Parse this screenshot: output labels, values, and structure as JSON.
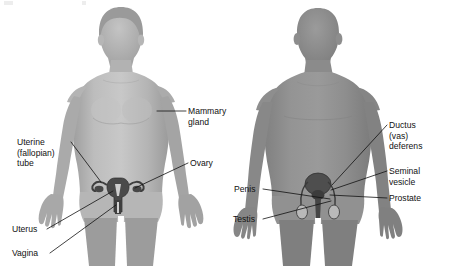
{
  "figure": {
    "background_color": "#ffffff",
    "width": 449,
    "height": 275,
    "label_color": "#111111",
    "leader_color": "#111111"
  },
  "female_figure": {
    "name": "female-body-silhouette",
    "body_fill": "#b0b0b0",
    "body_shade": "#9c9c9c",
    "highlight_fill": "#c9c9c9",
    "organ_fill": "#4a4a4a",
    "organ_stroke": "#2b2b2b",
    "labels": [
      {
        "id": "mammary-gland",
        "text_lines": [
          "Mammary",
          "gland"
        ],
        "text_x": 188,
        "text_y": 114,
        "anchor": "start",
        "leader_path": "M 186 111 L 157 111"
      },
      {
        "id": "uterine-fallopian-tube",
        "text_lines": [
          "Uterine",
          "(fallopian)",
          "tube"
        ],
        "text_x": 17,
        "text_y": 145,
        "anchor": "start",
        "leader_path": "M 71 142 L 101 182"
      },
      {
        "id": "ovary",
        "text_lines": [
          "Ovary"
        ],
        "text_x": 190,
        "text_y": 166,
        "anchor": "start",
        "leader_path": "M 188 163 L 135 188"
      },
      {
        "id": "uterus",
        "text_lines": [
          "Uterus"
        ],
        "text_x": 12,
        "text_y": 232,
        "anchor": "start",
        "leader_path": "M 47 229 L 113 191"
      },
      {
        "id": "vagina",
        "text_lines": [
          "Vagina"
        ],
        "text_x": 12,
        "text_y": 256,
        "anchor": "start",
        "leader_path": "M 50 253 L 116 205"
      }
    ]
  },
  "male_figure": {
    "name": "male-body-silhouette",
    "body_fill": "#8f8f8f",
    "body_shade": "#7d7d7d",
    "highlight_fill": "#a6a6a6",
    "organ_fill": "#4a4a4a",
    "organ_stroke": "#2b2b2b",
    "labels": [
      {
        "id": "ductus-vas-deferens",
        "text_lines": [
          "Ductus",
          "(vas)",
          "deferens"
        ],
        "text_x": 389,
        "text_y": 128,
        "anchor": "start",
        "leader_path": "M 387 125 L 332 185"
      },
      {
        "id": "seminal-vesicle",
        "text_lines": [
          "Seminal",
          "vesicle"
        ],
        "text_x": 389,
        "text_y": 174,
        "anchor": "start",
        "leader_path": "M 387 171 L 331 190"
      },
      {
        "id": "prostate",
        "text_lines": [
          "Prostate"
        ],
        "text_x": 389,
        "text_y": 201,
        "anchor": "start",
        "leader_path": "M 387 198 L 330 195"
      },
      {
        "id": "penis",
        "text_lines": [
          "Penis"
        ],
        "text_x": 234,
        "text_y": 192,
        "anchor": "start",
        "leader_path": "M 263 189 L 330 199"
      },
      {
        "id": "testis",
        "text_lines": [
          "Testis"
        ],
        "text_x": 233,
        "text_y": 222,
        "anchor": "start",
        "leader_path": "M 263 219 L 331 201"
      }
    ]
  }
}
